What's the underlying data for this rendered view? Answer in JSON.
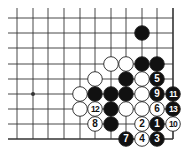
{
  "diagram": {
    "colors": {
      "background": "#ffffff",
      "line": "#333333",
      "black_stone": "#111111",
      "white_stone": "#ffffff",
      "stone_outline": "#222222"
    },
    "grid": {
      "columns_x": [
        17,
        33,
        48,
        64,
        80,
        95,
        111,
        126,
        142,
        157,
        173
      ],
      "rows_y": [
        18,
        33,
        48,
        64,
        79,
        94,
        109,
        124,
        139
      ],
      "right_edge": true,
      "bottom_edge": true,
      "open_top_to": 8,
      "open_left_to": 8
    },
    "star_points": [
      {
        "col": 1,
        "row": 5
      }
    ],
    "stones": [
      {
        "col": 8,
        "row": 1,
        "color": "black",
        "label": ""
      },
      {
        "col": 6,
        "row": 3,
        "color": "white",
        "label": ""
      },
      {
        "col": 7,
        "row": 3,
        "color": "white",
        "label": ""
      },
      {
        "col": 8,
        "row": 3,
        "color": "black",
        "label": ""
      },
      {
        "col": 9,
        "row": 3,
        "color": "black",
        "label": ""
      },
      {
        "col": 5,
        "row": 4,
        "color": "white",
        "label": ""
      },
      {
        "col": 7,
        "row": 4,
        "color": "black",
        "label": ""
      },
      {
        "col": 8,
        "row": 4,
        "color": "white",
        "label": ""
      },
      {
        "col": 9,
        "row": 4,
        "color": "black",
        "label": "5"
      },
      {
        "col": 4,
        "row": 5,
        "color": "white",
        "label": ""
      },
      {
        "col": 5,
        "row": 5,
        "color": "black",
        "label": ""
      },
      {
        "col": 6,
        "row": 5,
        "color": "black",
        "label": ""
      },
      {
        "col": 7,
        "row": 5,
        "color": "black",
        "label": ""
      },
      {
        "col": 8,
        "row": 5,
        "color": "white",
        "label": ""
      },
      {
        "col": 9,
        "row": 5,
        "color": "black",
        "label": "9"
      },
      {
        "col": 10,
        "row": 5,
        "color": "black",
        "label": "11"
      },
      {
        "col": 4,
        "row": 6,
        "color": "white",
        "label": ""
      },
      {
        "col": 5,
        "row": 6,
        "color": "white",
        "label": "12"
      },
      {
        "col": 6,
        "row": 6,
        "color": "black",
        "label": ""
      },
      {
        "col": 7,
        "row": 6,
        "color": "white",
        "label": ""
      },
      {
        "col": 8,
        "row": 6,
        "color": "white",
        "label": ""
      },
      {
        "col": 9,
        "row": 6,
        "color": "white",
        "label": "6"
      },
      {
        "col": 10,
        "row": 6,
        "color": "black",
        "label": "13"
      },
      {
        "col": 5,
        "row": 7,
        "color": "white",
        "label": "8"
      },
      {
        "col": 6,
        "row": 7,
        "color": "black",
        "label": ""
      },
      {
        "col": 8,
        "row": 7,
        "color": "white",
        "label": "2"
      },
      {
        "col": 9,
        "row": 7,
        "color": "black",
        "label": "1"
      },
      {
        "col": 10,
        "row": 7,
        "color": "white",
        "label": "10"
      },
      {
        "col": 7,
        "row": 8,
        "color": "black",
        "label": "7"
      },
      {
        "col": 8,
        "row": 8,
        "color": "white",
        "label": "4"
      },
      {
        "col": 9,
        "row": 8,
        "color": "black",
        "label": "3"
      }
    ]
  }
}
